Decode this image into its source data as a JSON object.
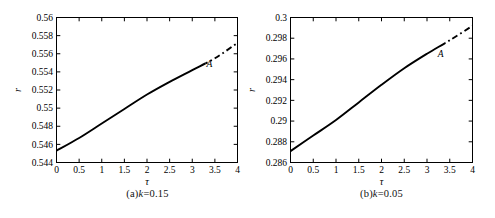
{
  "page": {
    "background": "#ffffff",
    "ink": "#000000"
  },
  "chart_data": [
    {
      "type": "line",
      "panel_id": "a",
      "title": "(a)k=0.15",
      "caption": {
        "prefix": "(a)",
        "variable": "k",
        "rest": "=0.15"
      },
      "xlabel": "τ",
      "ylabel": "r",
      "xlim": [
        0,
        4
      ],
      "ylim": [
        0.544,
        0.56
      ],
      "xticks": [
        0,
        0.5,
        1,
        1.5,
        2,
        2.5,
        3,
        3.5,
        4
      ],
      "xtick_labels": [
        "0",
        "0.5",
        "1",
        "1.5",
        "2",
        "2.5",
        "3",
        "3.5",
        "4"
      ],
      "yticks": [
        0.544,
        0.546,
        0.548,
        0.55,
        0.552,
        0.554,
        0.556,
        0.558,
        0.56
      ],
      "ytick_labels": [
        "0.544",
        "0.546",
        "0.548",
        "0.55",
        "0.552",
        "0.554",
        "0.556",
        "0.558",
        "0.56"
      ],
      "grid": false,
      "legend": null,
      "line_color": "#000000",
      "solid_until_x": 3.3,
      "dash_style_after": "dash-dot",
      "annotation": {
        "label": "A",
        "x": 3.38,
        "y": 0.5549
      },
      "series": [
        {
          "name": "r vs tau (k=0.15)",
          "x": [
            0,
            0.5,
            1,
            1.5,
            2,
            2.5,
            3,
            3.5,
            4
          ],
          "y": [
            0.5453,
            0.5467,
            0.5483,
            0.5499,
            0.5515,
            0.5529,
            0.5542,
            0.5555,
            0.5572
          ]
        }
      ]
    },
    {
      "type": "line",
      "panel_id": "b",
      "title": "(b)k=0.05",
      "caption": {
        "prefix": "(b)",
        "variable": "k",
        "rest": "=0.05"
      },
      "xlabel": "τ",
      "ylabel": "r",
      "xlim": [
        0,
        4
      ],
      "ylim": [
        0.286,
        0.3
      ],
      "xticks": [
        0,
        0.5,
        1,
        1.5,
        2,
        2.5,
        3,
        3.5,
        4
      ],
      "xtick_labels": [
        "0",
        "0.5",
        "1",
        "1.5",
        "2",
        "2.5",
        "3",
        "3.5",
        "4"
      ],
      "yticks": [
        0.286,
        0.288,
        0.29,
        0.292,
        0.294,
        0.296,
        0.298,
        0.3
      ],
      "ytick_labels": [
        "0.286",
        "0.288",
        "0.29",
        "0.292",
        "0.294",
        "0.296",
        "0.298",
        "0.3"
      ],
      "grid": false,
      "legend": null,
      "line_color": "#000000",
      "solid_until_x": 3.4,
      "dash_style_after": "dash-dot",
      "annotation": {
        "label": "A",
        "x": 3.3,
        "y": 0.2965
      },
      "series": [
        {
          "name": "r vs tau (k=0.05)",
          "x": [
            0,
            0.5,
            1,
            1.5,
            2,
            2.5,
            3,
            3.5,
            4
          ],
          "y": [
            0.2871,
            0.2886,
            0.2901,
            0.2918,
            0.2935,
            0.2951,
            0.2965,
            0.2978,
            0.2992
          ]
        }
      ]
    }
  ]
}
